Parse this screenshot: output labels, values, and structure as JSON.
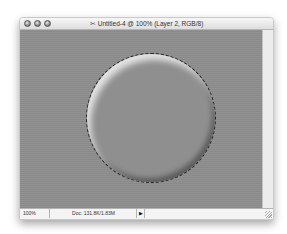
{
  "window": {
    "title": "Untitled-4 @ 100% (Layer 2, RGB/8)",
    "doc_icon": "photoshop-document-icon",
    "controls": [
      "close",
      "minimize",
      "zoom"
    ]
  },
  "canvas": {
    "background_color": "#8e8e8e",
    "shape": "beveled-circle",
    "selection": "marching-ants-circle"
  },
  "statusbar": {
    "zoom": "100%",
    "doc_info": "Doc: 131.8K/1.83M",
    "menu_arrow": "▶"
  }
}
